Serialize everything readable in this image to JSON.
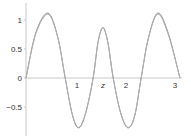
{
  "chart_data": {
    "type": "line",
    "title": "",
    "xlabel": "z",
    "ylabel": "",
    "xlim": [
      0,
      3.14159
    ],
    "ylim": [
      -0.95,
      1.15
    ],
    "grid": false,
    "legend": null,
    "x_ticks": [
      "1",
      "2",
      "3"
    ],
    "x_tick_values": [
      1,
      2,
      3
    ],
    "y_ticks": [
      "1",
      "0.5",
      "0",
      "−0.5"
    ],
    "y_tick_values": [
      1,
      0.5,
      0,
      -0.5
    ],
    "series": [
      {
        "name": "curve-a",
        "color": "#8a8a8a",
        "x": [
          0,
          0.2,
          0.45,
          0.65,
          0.8,
          0.95,
          1.08,
          1.22,
          1.37,
          1.47,
          1.57,
          1.67,
          1.78,
          1.93,
          2.08,
          2.22,
          2.35,
          2.5,
          2.69,
          2.9,
          3.14159
        ],
        "y": [
          0,
          0.78,
          1.12,
          0.7,
          0,
          -0.65,
          -0.86,
          -0.6,
          0,
          0.62,
          0.87,
          0.62,
          0,
          -0.6,
          -0.86,
          -0.65,
          0,
          0.7,
          1.12,
          0.78,
          0
        ]
      },
      {
        "name": "curve-b",
        "color": "#b0b0b0",
        "x": [
          0,
          0.2,
          0.45,
          0.65,
          0.8,
          0.95,
          1.08,
          1.22,
          1.37,
          1.47,
          1.57,
          1.67,
          1.78,
          1.93,
          2.08,
          2.22,
          2.35,
          2.5,
          2.69,
          2.9,
          3.14159
        ],
        "y": [
          0,
          0.76,
          1.1,
          0.69,
          0,
          -0.64,
          -0.85,
          -0.59,
          0,
          0.61,
          0.86,
          0.61,
          0,
          -0.59,
          -0.85,
          -0.64,
          0,
          0.69,
          1.1,
          0.76,
          0
        ]
      }
    ]
  },
  "axes": {
    "x_axis_label": "z",
    "axis_color": "#c8c8c8"
  }
}
